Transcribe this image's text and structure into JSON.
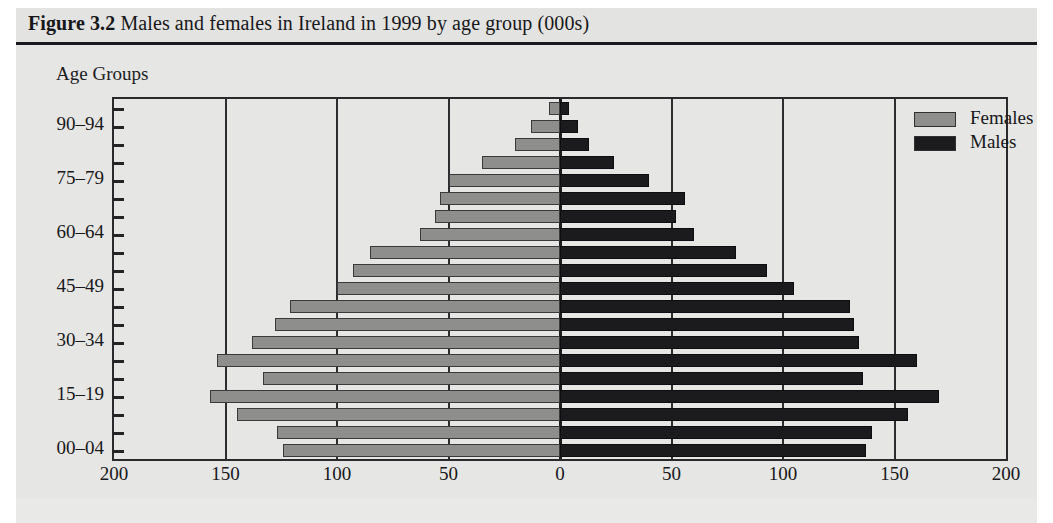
{
  "figure": {
    "label": "Figure 3.2",
    "caption": " Males and females in Ireland in 1999 by age group (000s)"
  },
  "axis_title": "Age Groups",
  "legend": {
    "position": "top-right",
    "entries": [
      {
        "label": "Females",
        "color": "#8e8e8c"
      },
      {
        "label": "Males",
        "color": "#1b1b1d"
      }
    ]
  },
  "chart_data": {
    "type": "bar",
    "subtype": "population-pyramid",
    "title": "Figure 3.2 Males and females in Ireland in 1999 by age group (000s)",
    "xlabel": "",
    "ylabel": "Age Groups",
    "units": "thousands (000s)",
    "grid": true,
    "xlim": [
      -200,
      200
    ],
    "xticks": [
      -200,
      -150,
      -100,
      -50,
      0,
      50,
      100,
      150,
      200
    ],
    "xticklabels": [
      "200",
      "150",
      "100",
      "50",
      "0",
      "50",
      "100",
      "150",
      "200"
    ],
    "yticklabels_shown": [
      "00–04",
      "15–19",
      "30–34",
      "45–49",
      "60–64",
      "75–79",
      "90–94"
    ],
    "categories": [
      "00–04",
      "05–09",
      "10–14",
      "15–19",
      "20–24",
      "25–29",
      "30–34",
      "35–39",
      "40–44",
      "45–49",
      "50–54",
      "55–59",
      "60–64",
      "65–69",
      "70–74",
      "75–79",
      "80–84",
      "85–89",
      "90–94",
      "95+"
    ],
    "series": [
      {
        "name": "Females",
        "side": "left",
        "color": "#8e8e8c",
        "values": [
          124,
          127,
          145,
          157,
          133,
          154,
          138,
          128,
          121,
          100,
          93,
          85,
          63,
          56,
          54,
          50,
          35,
          20,
          13,
          5
        ]
      },
      {
        "name": "Males",
        "side": "right",
        "color": "#1b1b1d",
        "values": [
          137,
          140,
          156,
          170,
          136,
          160,
          134,
          132,
          130,
          105,
          93,
          79,
          60,
          52,
          56,
          40,
          24,
          13,
          8,
          4
        ]
      }
    ]
  }
}
